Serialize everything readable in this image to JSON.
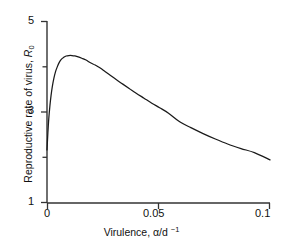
{
  "chart_data": {
    "type": "line",
    "title": "",
    "subtitle": "",
    "xlabel": "Virulence, α/d ⁻¹",
    "ylabel": "Reproductive rate of virus, R₀",
    "xlim": [
      0,
      0.1
    ],
    "ylim": [
      1,
      5
    ],
    "grid": false,
    "legend": null,
    "xticks": [
      0,
      0.05,
      0.1
    ],
    "xtick_labels": [
      "0",
      "0.05",
      "0.1"
    ],
    "yticks": [
      1,
      2,
      3,
      4,
      5
    ],
    "ytick_labels": [
      "1",
      "",
      "3",
      "",
      "5"
    ],
    "ytick_labels_shown": [
      "5",
      "3",
      "1"
    ],
    "minor_yticks": [
      2,
      4
    ],
    "series": [
      {
        "name": "R0 vs virulence",
        "color": "#1a1a1a",
        "x": [
          0.0,
          0.0004,
          0.0008,
          0.0013,
          0.0018,
          0.0024,
          0.0031,
          0.0038,
          0.0046,
          0.0055,
          0.0065,
          0.0075,
          0.0086,
          0.0098,
          0.0112,
          0.0125,
          0.014,
          0.0156,
          0.0175,
          0.0195,
          0.0216,
          0.0237,
          0.026,
          0.0285,
          0.031,
          0.034,
          0.037,
          0.04,
          0.0435,
          0.047,
          0.0505,
          0.0545,
          0.0595,
          0.0645,
          0.07,
          0.0755,
          0.081,
          0.087,
          0.093,
          0.1
        ],
        "y": [
          2.17,
          2.55,
          2.86,
          3.14,
          3.36,
          3.57,
          3.75,
          3.89,
          4.0,
          4.1,
          4.17,
          4.21,
          4.24,
          4.25,
          4.25,
          4.24,
          4.22,
          4.19,
          4.15,
          4.09,
          4.04,
          3.98,
          3.9,
          3.81,
          3.72,
          3.62,
          3.52,
          3.42,
          3.31,
          3.2,
          3.1,
          2.98,
          2.79,
          2.66,
          2.53,
          2.41,
          2.3,
          2.2,
          2.11,
          1.95
        ],
        "peak_x": 0.0112,
        "peak_y": 4.25,
        "start_y": 2.17,
        "end_y": 1.95
      }
    ],
    "axis_color": "#333333",
    "background": "#ffffff"
  },
  "labels": {
    "ytick_5": "5",
    "ytick_3": "3",
    "ytick_1": "1",
    "xtick_0": "0",
    "xtick_005": "0.05",
    "xtick_01": "0.1"
  }
}
